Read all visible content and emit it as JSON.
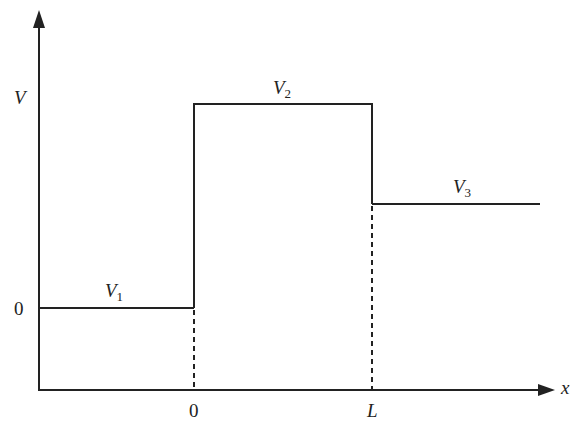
{
  "diagram": {
    "axes": {
      "y_label": "V",
      "x_label": "x",
      "y_zero_label": "0",
      "x_tick_labels": [
        "0",
        "L"
      ]
    },
    "regions": [
      {
        "name": "V1",
        "label_main": "V",
        "label_sub": "1",
        "x_range": "x < 0",
        "level": "0"
      },
      {
        "name": "V2",
        "label_main": "V",
        "label_sub": "2",
        "x_range": "0 < x < L",
        "level": "high"
      },
      {
        "name": "V3",
        "label_main": "V",
        "label_sub": "3",
        "x_range": "x > L",
        "level": "intermediate"
      }
    ],
    "colors": {
      "line": "#222222",
      "background": "#ffffff"
    }
  }
}
